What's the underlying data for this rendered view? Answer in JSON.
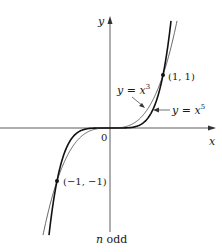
{
  "figure": {
    "caption": "n odd",
    "caption_italic_part": "n",
    "caption_rest": " odd",
    "axes": {
      "x_label": "x",
      "y_label": "y",
      "origin_label": "0"
    },
    "curves": [
      {
        "name": "y = x^3",
        "label_prefix": "y = x",
        "exponent": "3",
        "n": 3,
        "color": "#555555",
        "width": 0.9
      },
      {
        "name": "y = x^5",
        "label_prefix": "y = x",
        "exponent": "5",
        "n": 5,
        "color": "#111111",
        "width": 1.6
      }
    ],
    "points": [
      {
        "label": "(1, 1)",
        "x": 1,
        "y": 1
      },
      {
        "label": "(−1, −1)",
        "x": -1,
        "y": -1
      }
    ]
  },
  "chart_data": {
    "type": "line",
    "title": "n odd",
    "xlabel": "x",
    "ylabel": "y",
    "series": [
      {
        "name": "y = x^3",
        "x": [
          -1.6,
          -1.2,
          -1,
          -0.6,
          -0.3,
          0,
          0.3,
          0.6,
          1,
          1.2,
          1.6
        ],
        "values": [
          -4.096,
          -1.728,
          -1,
          -0.216,
          -0.027,
          0,
          0.027,
          0.216,
          1,
          1.728,
          4.096
        ]
      },
      {
        "name": "y = x^5",
        "x": [
          -1.35,
          -1.2,
          -1,
          -0.6,
          -0.3,
          0,
          0.3,
          0.6,
          1,
          1.2,
          1.35
        ],
        "values": [
          -4.484,
          -2.488,
          -1,
          -0.078,
          -0.002,
          0,
          0.002,
          0.078,
          1,
          2.488,
          4.484
        ]
      }
    ],
    "annotations": [
      "(1, 1)",
      "(−1, −1)",
      "0"
    ],
    "xlim": [
      -2.1,
      1.95
    ],
    "ylim": [
      -3.3,
      2.1
    ],
    "grid": false,
    "legend": "none (inline labels)"
  }
}
